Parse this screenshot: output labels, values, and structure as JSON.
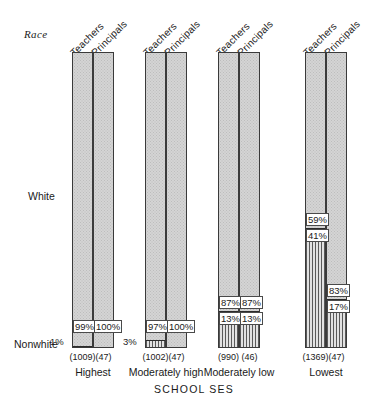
{
  "chart_data": {
    "type": "bar",
    "subtype": "100% stacked bar",
    "title": "",
    "xlabel": "SCHOOL SES",
    "ylabel": "Race",
    "ylim": [
      0,
      100
    ],
    "grid": false,
    "legend": "none",
    "row_labels": {
      "top": "White",
      "bottom": "Nonwhite"
    },
    "categories": [
      "Highest",
      "Moderately high",
      "Moderately low",
      "Lowest"
    ],
    "series_names": [
      "Teachers",
      "Principals"
    ],
    "segments": [
      "White",
      "Nonwhite"
    ],
    "groups": [
      {
        "category": "Highest",
        "bars": [
          {
            "series": "Teachers",
            "n": "(1009)",
            "n_value": 1009,
            "white": 99,
            "nonwhite": 1,
            "white_label": "99%",
            "nonwhite_label": "1%"
          },
          {
            "series": "Principals",
            "n": "(47)",
            "n_value": 47,
            "white": 100,
            "nonwhite": 0,
            "white_label": "100%",
            "nonwhite_label": ""
          }
        ]
      },
      {
        "category": "Moderately high",
        "bars": [
          {
            "series": "Teachers",
            "n": "(1002)",
            "n_value": 1002,
            "white": 97,
            "nonwhite": 3,
            "white_label": "97%",
            "nonwhite_label": "3%"
          },
          {
            "series": "Principals",
            "n": "(47)",
            "n_value": 47,
            "white": 100,
            "nonwhite": 0,
            "white_label": "100%",
            "nonwhite_label": ""
          }
        ]
      },
      {
        "category": "Moderately low",
        "bars": [
          {
            "series": "Teachers",
            "n": "(990)",
            "n_value": 990,
            "white": 87,
            "nonwhite": 13,
            "white_label": "87%",
            "nonwhite_label": "13%"
          },
          {
            "series": "Principals",
            "n": "(46)",
            "n_value": 46,
            "white": 87,
            "nonwhite": 13,
            "white_label": "87%",
            "nonwhite_label": "13%"
          }
        ]
      },
      {
        "category": "Lowest",
        "bars": [
          {
            "series": "Teachers",
            "n": "(1369)",
            "n_value": 1369,
            "white": 59,
            "nonwhite": 41,
            "white_label": "59%",
            "nonwhite_label": "41%"
          },
          {
            "series": "Principals",
            "n": "(47)",
            "n_value": 47,
            "white": 83,
            "nonwhite": 17,
            "white_label": "83%",
            "nonwhite_label": "17%"
          }
        ]
      }
    ]
  },
  "colors": {
    "white_segment": "#d4d4d4",
    "nonwhite_segment": "#cfcfcf",
    "hatch": "#5a5a5a",
    "outline": "#3a3a3a",
    "text": "#1a1a1a"
  }
}
